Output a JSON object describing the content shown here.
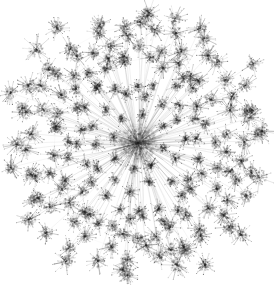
{
  "figure": {
    "title": "",
    "type": "network-graph",
    "layout": "radial-hub-and-spoke",
    "description": "Dandelion-like radial network graph: one dense central hub with many edges radiating outward to leaf clusters, each leaf cluster itself a small dense starburst of micro-nodes.",
    "canvas": {
      "width": 274,
      "height": 292
    },
    "background_color": "#ffffff",
    "ink_color": "#202020",
    "edge_color": "#8c8c8c",
    "node_color": "#3a3a3a",
    "rendering": "antialiased grayscale, soft / blurred strokes",
    "has_axes": false,
    "has_legend": false,
    "has_text_labels": false
  },
  "chart_data": {
    "type": "scatter",
    "title": "",
    "xlabel": "",
    "ylabel": "",
    "xlim": [
      0,
      274
    ],
    "ylim": [
      0,
      292
    ],
    "grid": false,
    "legend": "none",
    "hub": {
      "x": 138,
      "y": 143,
      "radius": 13,
      "weight": 1.0
    },
    "ring_counts": [
      8,
      14,
      20,
      26,
      30,
      32,
      26,
      14
    ],
    "ring_radii": [
      26,
      44,
      60,
      76,
      91,
      105,
      118,
      130
    ],
    "ring_jitter": [
      5,
      6,
      7,
      8,
      8,
      9,
      9,
      10
    ],
    "cluster_radius_range": [
      3.2,
      7.0
    ],
    "cluster_hair_count": 16,
    "outliers": [
      {
        "name": "outlier-top-left",
        "x": 57,
        "y": 28,
        "radius": 6.5
      },
      {
        "name": "outlier-bottom-right",
        "x": 205,
        "y": 265,
        "radius": 6.0
      },
      {
        "name": "outlier-top-center",
        "x": 140,
        "y": 22,
        "radius": 6.0
      },
      {
        "name": "outlier-right",
        "x": 252,
        "y": 110,
        "radius": 5.5
      },
      {
        "name": "outlier-left",
        "x": 22,
        "y": 108,
        "radius": 5.5
      }
    ],
    "bounds": {
      "left": 15,
      "top": 18,
      "right": 258,
      "bottom": 274
    },
    "node_count_estimate": 176,
    "edge_count_estimate": 176,
    "micro_node_count_estimate": 2800
  }
}
